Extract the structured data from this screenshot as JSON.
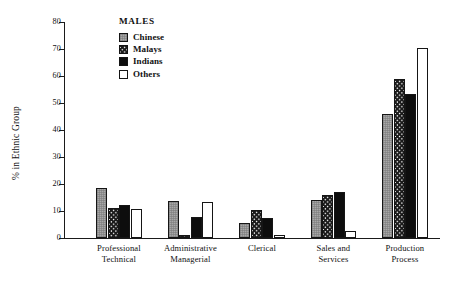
{
  "chart_data": {
    "type": "bar",
    "title": "",
    "xlabel": "",
    "ylabel": "% in Ethnic Group",
    "ylim": [
      0,
      80
    ],
    "ytick_step": 10,
    "yticks": [
      0,
      10,
      20,
      30,
      40,
      50,
      60,
      70,
      80
    ],
    "grid": false,
    "legend_position": "top-left inside plot",
    "legend_title": "MALES",
    "categories": [
      "Professional Technical",
      "Administrative Managerial",
      "Clerical",
      "Sales and Services",
      "Production Process"
    ],
    "category_lines": [
      [
        "Professional",
        "Technical"
      ],
      [
        "Administrative",
        "Managerial"
      ],
      [
        "Clerical",
        ""
      ],
      [
        "Sales  and",
        "Services"
      ],
      [
        "Production",
        "Process"
      ]
    ],
    "series": [
      {
        "name": "Chinese",
        "fill": "gray-dotted",
        "color": "#a8a8a8",
        "values": [
          18.5,
          13.7,
          5.7,
          14.0,
          45.8
        ]
      },
      {
        "name": "Malays",
        "fill": "checkerboard",
        "color": "#ffffff",
        "values": [
          11.1,
          1.2,
          10.4,
          16.0,
          59.0
        ]
      },
      {
        "name": "Indians",
        "fill": "solid-black",
        "color": "#0d0d0d",
        "values": [
          12.4,
          7.9,
          7.4,
          16.9,
          53.4
        ]
      },
      {
        "name": "Others",
        "fill": "white-outline",
        "color": "#ffffff",
        "values": [
          10.7,
          13.4,
          1.0,
          2.7,
          70.3
        ]
      }
    ]
  },
  "legend": {
    "title": "MALES",
    "items": [
      {
        "label": "Chinese"
      },
      {
        "label": "Malays"
      },
      {
        "label": "Indians"
      },
      {
        "label": "Others"
      }
    ]
  },
  "axes": {
    "y_title": "% in Ethnic Group",
    "y_labels": [
      "0",
      "10",
      "20",
      "30",
      "40",
      "50",
      "60",
      "70",
      "80"
    ]
  }
}
